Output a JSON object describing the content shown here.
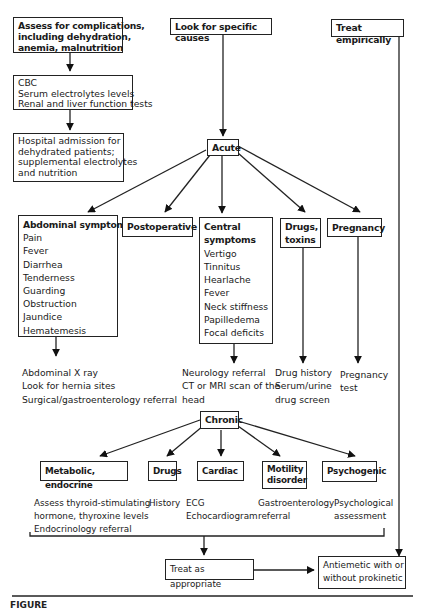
{
  "top": {
    "assess": {
      "lines": [
        "Assess for complications,",
        "including dehydration,",
        "anemia, malnutrition"
      ]
    },
    "labs": {
      "lines": [
        "CBC",
        "Serum electrolytes levels",
        "Renal and liver function tests"
      ]
    },
    "hospital": {
      "lines": [
        "Hospital admission for",
        "dehydrated patients;",
        "supplemental electrolytes",
        "and nutrition"
      ]
    },
    "look": {
      "label": "Look for specific causes"
    },
    "empiric": {
      "label": "Treat empirically"
    }
  },
  "acute": {
    "label": "Acute",
    "abdominal": {
      "title": "Abdominal symptoms",
      "items": [
        "Pain",
        "Fever",
        "Diarrhea",
        "Tenderness",
        "Guarding",
        "Obstruction",
        "Jaundice",
        "Hematemesis"
      ],
      "actions": [
        "Abdominal X ray",
        "Look for hernia sites",
        "Surgical/gastroenterology referral"
      ]
    },
    "postoperative": {
      "title": "Postoperative"
    },
    "central": {
      "title_lines": [
        "Central",
        "symptoms"
      ],
      "items": [
        "Vertigo",
        "Tinnitus",
        "Hearlache",
        "Fever",
        "Neck stiffness",
        "Papilledema",
        "Focal deficits"
      ],
      "actions": [
        "Neurology referral",
        "CT or MRI scan of the",
        "head"
      ]
    },
    "drugs": {
      "title_lines": [
        "Drugs,",
        "toxins"
      ],
      "actions": [
        "Drug history",
        "Serum/urine",
        "drug screen"
      ]
    },
    "pregnancy": {
      "title": "Pregnancy",
      "actions": [
        "Pregnancy",
        "test"
      ]
    }
  },
  "chronic": {
    "label": "Chronic",
    "metabolic": {
      "title": "Metabolic, endocrine",
      "actions": [
        "Assess thyroid-stimulating",
        "hormone, thyroxine levels",
        "Endocrinology referral"
      ]
    },
    "drugs": {
      "title": "Drugs",
      "actions": [
        "History"
      ]
    },
    "cardiac": {
      "title": "Cardiac",
      "actions": [
        "ECG",
        "Echocardiogram"
      ]
    },
    "motility": {
      "title_lines": [
        "Motility",
        "disorder"
      ],
      "actions": [
        "Gastroenterology",
        "referral"
      ]
    },
    "psychogenic": {
      "title": "Psychogenic",
      "actions": [
        "Psychological",
        "assessment"
      ]
    }
  },
  "bottom": {
    "treat": {
      "label": "Treat as appropriate"
    },
    "antiemetic": {
      "lines": [
        "Antiemetic with or",
        "without prokinetic"
      ]
    }
  },
  "caption": {
    "label": "FIGURE"
  }
}
